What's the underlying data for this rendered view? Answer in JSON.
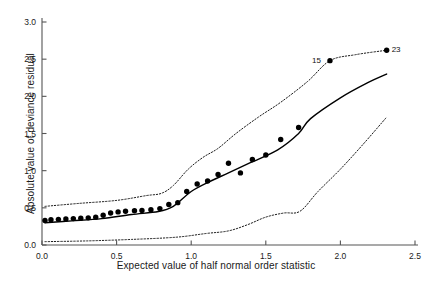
{
  "chart_data": {
    "type": "scatter",
    "title": "",
    "subtitle": "",
    "xlabel": "Expected value of half normal order statistic",
    "ylabel": "Absolute value of deviance residual",
    "xlim": [
      0.0,
      2.5
    ],
    "ylim": [
      0.0,
      3.0
    ],
    "xticks": [
      0.0,
      0.5,
      1.0,
      1.5,
      2.0,
      2.5
    ],
    "xticklabels": [
      "0.0",
      "0.5",
      "1.0",
      "1.5",
      "2.0",
      "2.5"
    ],
    "yticks": [
      0.0,
      0.5,
      1.0,
      1.5,
      2.0,
      2.5,
      3.0
    ],
    "yticklabels": [
      "0.0",
      "0.5",
      "1.0",
      "1.5",
      "2.0",
      "2.5",
      "3.0"
    ],
    "grid": false,
    "legend": "none",
    "spines": [
      "left",
      "bottom"
    ],
    "marker": "filled-circle",
    "marker_color": "#000000",
    "line_color": "#000000",
    "envelope_style": "dotted",
    "points": [
      {
        "x": 0.02,
        "y": 0.33
      },
      {
        "x": 0.06,
        "y": 0.34
      },
      {
        "x": 0.11,
        "y": 0.345
      },
      {
        "x": 0.16,
        "y": 0.35
      },
      {
        "x": 0.21,
        "y": 0.355
      },
      {
        "x": 0.26,
        "y": 0.36
      },
      {
        "x": 0.31,
        "y": 0.365
      },
      {
        "x": 0.36,
        "y": 0.375
      },
      {
        "x": 0.41,
        "y": 0.4
      },
      {
        "x": 0.46,
        "y": 0.43
      },
      {
        "x": 0.51,
        "y": 0.445
      },
      {
        "x": 0.56,
        "y": 0.455
      },
      {
        "x": 0.62,
        "y": 0.46
      },
      {
        "x": 0.67,
        "y": 0.465
      },
      {
        "x": 0.73,
        "y": 0.475
      },
      {
        "x": 0.79,
        "y": 0.49
      },
      {
        "x": 0.85,
        "y": 0.545
      },
      {
        "x": 0.91,
        "y": 0.57
      },
      {
        "x": 0.97,
        "y": 0.72
      },
      {
        "x": 1.04,
        "y": 0.82
      },
      {
        "x": 1.11,
        "y": 0.86
      },
      {
        "x": 1.18,
        "y": 0.95
      },
      {
        "x": 1.25,
        "y": 1.1
      },
      {
        "x": 1.33,
        "y": 0.97
      },
      {
        "x": 1.41,
        "y": 1.15
      },
      {
        "x": 1.5,
        "y": 1.21
      },
      {
        "x": 1.6,
        "y": 1.42
      },
      {
        "x": 1.72,
        "y": 1.58
      },
      {
        "x": 1.93,
        "y": 2.48
      },
      {
        "x": 2.31,
        "y": 2.62
      }
    ],
    "median_line": [
      {
        "x": 0.02,
        "y": 0.3
      },
      {
        "x": 0.2,
        "y": 0.325
      },
      {
        "x": 0.4,
        "y": 0.355
      },
      {
        "x": 0.6,
        "y": 0.41
      },
      {
        "x": 0.78,
        "y": 0.45
      },
      {
        "x": 0.88,
        "y": 0.52
      },
      {
        "x": 1.0,
        "y": 0.72
      },
      {
        "x": 1.12,
        "y": 0.85
      },
      {
        "x": 1.25,
        "y": 0.97
      },
      {
        "x": 1.4,
        "y": 1.11
      },
      {
        "x": 1.58,
        "y": 1.28
      },
      {
        "x": 1.72,
        "y": 1.5
      },
      {
        "x": 1.8,
        "y": 1.7
      },
      {
        "x": 2.0,
        "y": 1.98
      },
      {
        "x": 2.18,
        "y": 2.18
      },
      {
        "x": 2.31,
        "y": 2.3
      }
    ],
    "upper_envelope": [
      {
        "x": 0.02,
        "y": 0.52
      },
      {
        "x": 0.25,
        "y": 0.56
      },
      {
        "x": 0.5,
        "y": 0.6
      },
      {
        "x": 0.7,
        "y": 0.665
      },
      {
        "x": 0.8,
        "y": 0.695
      },
      {
        "x": 0.88,
        "y": 0.8
      },
      {
        "x": 0.98,
        "y": 1.02
      },
      {
        "x": 1.08,
        "y": 1.18
      },
      {
        "x": 1.18,
        "y": 1.3
      },
      {
        "x": 1.3,
        "y": 1.5
      },
      {
        "x": 1.45,
        "y": 1.72
      },
      {
        "x": 1.6,
        "y": 1.92
      },
      {
        "x": 1.78,
        "y": 2.2
      },
      {
        "x": 1.93,
        "y": 2.48
      },
      {
        "x": 2.1,
        "y": 2.56
      },
      {
        "x": 2.31,
        "y": 2.62
      }
    ],
    "lower_envelope": [
      {
        "x": 0.02,
        "y": 0.045
      },
      {
        "x": 0.3,
        "y": 0.055
      },
      {
        "x": 0.6,
        "y": 0.075
      },
      {
        "x": 0.9,
        "y": 0.105
      },
      {
        "x": 1.1,
        "y": 0.155
      },
      {
        "x": 1.25,
        "y": 0.19
      },
      {
        "x": 1.38,
        "y": 0.275
      },
      {
        "x": 1.5,
        "y": 0.375
      },
      {
        "x": 1.62,
        "y": 0.43
      },
      {
        "x": 1.73,
        "y": 0.455
      },
      {
        "x": 1.85,
        "y": 0.72
      },
      {
        "x": 2.0,
        "y": 1.02
      },
      {
        "x": 2.15,
        "y": 1.35
      },
      {
        "x": 2.31,
        "y": 1.72
      }
    ],
    "annotations": [
      {
        "text": "15",
        "x": 1.93,
        "y": 2.48,
        "anchor": "right"
      },
      {
        "text": "23",
        "x": 2.31,
        "y": 2.62,
        "anchor": "left"
      }
    ]
  }
}
